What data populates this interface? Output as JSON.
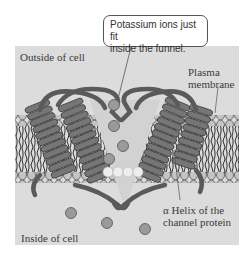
{
  "diagram": {
    "callout": {
      "line1": "Potassium ions just fit",
      "line2": "inside the funnel."
    },
    "labels": {
      "outside": "Outside of cell",
      "membrane_line1": "Plasma",
      "membrane_line2": "membrane",
      "helix_line1": "α Helix of the",
      "helix_line2": "channel protein",
      "inside": "Inside of cell"
    },
    "colors": {
      "background": "#dcdcdc",
      "protein": "#6e6e6e",
      "ion": "#9a9a9a",
      "lipid_head": "#c4c4c4"
    }
  }
}
